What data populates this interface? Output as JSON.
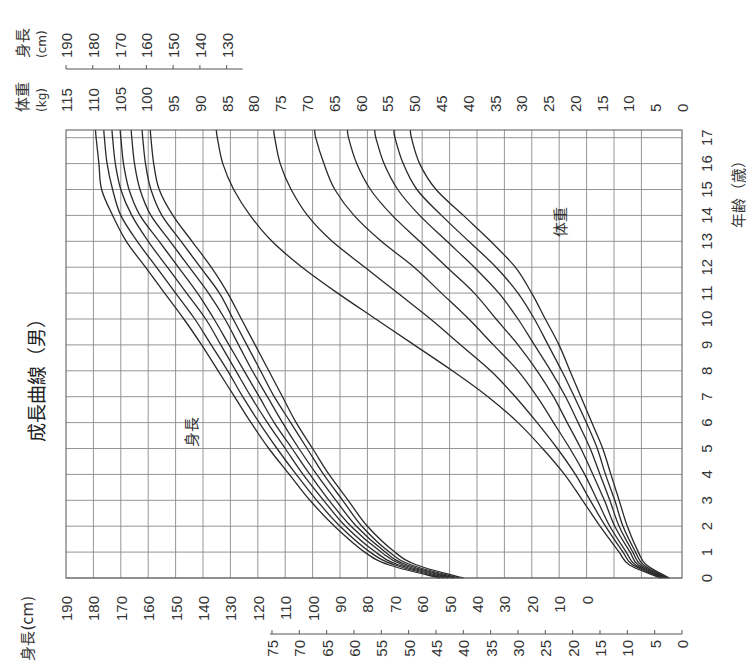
{
  "chart_data": {
    "type": "line",
    "title": "成長曲線（男）",
    "orientation": "rotated 90° counter-clockwise (age axis runs bottom-to-top on page)",
    "xlabel": "年齢（歳）",
    "x_ticks": [
      0,
      1,
      2,
      3,
      4,
      5,
      6,
      7,
      8,
      9,
      10,
      11,
      12,
      13,
      14,
      15,
      16,
      17
    ],
    "xlim": [
      0,
      17
    ],
    "y_axes": [
      {
        "name": "身長(cm)",
        "position": "left/bottom",
        "ticks": [
          190,
          180,
          170,
          160,
          150,
          140,
          130,
          120,
          110,
          100,
          90,
          80,
          70,
          60,
          50,
          40,
          30,
          20,
          10,
          0
        ],
        "range": [
          0,
          190
        ]
      },
      {
        "name": "体重(kg)",
        "position": "left/bottom",
        "ticks": [
          75,
          70,
          65,
          60,
          55,
          50,
          45,
          40,
          35,
          30,
          25,
          20,
          15,
          10,
          5,
          0
        ],
        "range": [
          0,
          75
        ]
      },
      {
        "name": "体重(kg)",
        "position": "right/top",
        "ticks": [
          115,
          110,
          105,
          100,
          95,
          90,
          85,
          80,
          75,
          70,
          65,
          60,
          55,
          50,
          45,
          40,
          35,
          30,
          25,
          20,
          15,
          10,
          5,
          0
        ],
        "range": [
          0,
          115
        ]
      },
      {
        "name": "身長(cm)",
        "position": "right/top",
        "ticks": [
          190,
          180,
          170,
          160,
          150,
          140,
          130
        ],
        "range": [
          130,
          190
        ]
      }
    ],
    "grid": true,
    "annotations": [
      "身長",
      "体重"
    ],
    "series_groups": [
      {
        "name": "身長",
        "unit": "cm",
        "percentiles": [
          "3",
          "10",
          "25",
          "50",
          "75",
          "90",
          "97"
        ],
        "x": [
          0,
          0.5,
          1,
          2,
          3,
          4,
          5,
          6,
          7,
          8,
          9,
          10,
          11,
          12,
          13,
          14,
          15,
          16,
          17
        ],
        "series": [
          {
            "name": "3%",
            "values": [
              45,
              62,
              70,
              80,
              87,
              94,
              100,
              106,
              111,
              116,
              121,
              126,
              131,
              137,
              144,
              151,
              156,
              158,
              159
            ]
          },
          {
            "name": "10%",
            "values": [
              46.5,
              64,
              72,
              82,
              89,
              96,
              102,
              108,
              114,
              119,
              124,
              129,
              134,
              141,
              148,
              155,
              159,
              161,
              162
            ]
          },
          {
            "name": "25%",
            "values": [
              48,
              65.5,
              73.5,
              84,
              91.5,
              98.5,
              105,
              111,
              116.5,
              122,
              127,
              132,
              138,
              145,
              152,
              159,
              163,
              165,
              166
            ]
          },
          {
            "name": "50%",
            "values": [
              49,
              67,
              75,
              86,
              94,
              101,
              107.5,
              114,
              119.5,
              125,
              130.5,
              136,
              142,
              149,
              156,
              163,
              167,
              169,
              170
            ]
          },
          {
            "name": "75%",
            "values": [
              50.5,
              68.5,
              77,
              88,
              96,
              103.5,
              110,
              116.5,
              122.5,
              128,
              133.5,
              139,
              146,
              153,
              160,
              166,
              170,
              172,
              173
            ]
          },
          {
            "name": "90%",
            "values": [
              52,
              70,
              79,
              90,
              98.5,
              106,
              113,
              119.5,
              125.5,
              131,
              137,
              143,
              150,
              157,
              164,
              170,
              173,
              175,
              176
            ]
          },
          {
            "name": "97%",
            "values": [
              53.5,
              72,
              81,
              92,
              101,
              108.5,
              116,
              122.5,
              128.5,
              134.5,
              140.5,
              147,
              154,
              161,
              168,
              173,
              177,
              178,
              179
            ]
          }
        ]
      },
      {
        "name": "体重",
        "unit": "kg",
        "percentiles": [
          "3",
          "10",
          "25",
          "50",
          "75",
          "90",
          "97"
        ],
        "x": [
          0,
          0.5,
          1,
          2,
          3,
          4,
          5,
          6,
          7,
          8,
          9,
          10,
          11,
          12,
          13,
          14,
          15,
          16,
          17
        ],
        "series": [
          {
            "name": "3%",
            "values": [
              2.3,
              6.5,
              8,
              10,
              11.5,
              13,
              14.5,
              16.5,
              18.5,
              20.5,
              22.5,
              25,
              27.5,
              30.5,
              35,
              40,
              45,
              48,
              49.5
            ]
          },
          {
            "name": "10%",
            "values": [
              2.6,
              7,
              8.5,
              10.8,
              12.3,
              14,
              15.5,
              17.5,
              19.7,
              22,
              24.5,
              27,
              30,
              34,
              39,
              44,
              48.5,
              51,
              52.5
            ]
          },
          {
            "name": "25%",
            "values": [
              2.8,
              7.5,
              9,
              11.5,
              13.2,
              15,
              16.8,
              19,
              21.3,
              24,
              27,
              30,
              33.5,
              38,
              43,
              48,
              52,
              54.5,
              56
            ]
          },
          {
            "name": "50%",
            "values": [
              3.0,
              8,
              9.5,
              12.3,
              14.2,
              16.3,
              18.5,
              21,
              23.5,
              26.5,
              30,
              34,
              38,
              43,
              48,
              53,
              57,
              59.5,
              61
            ]
          },
          {
            "name": "75%",
            "values": [
              3.3,
              8.5,
              10.2,
              13.2,
              15.5,
              17.8,
              20.5,
              23.5,
              26.5,
              30,
              34.5,
              39,
              44,
              49,
              55,
              60,
              63.5,
              65.5,
              67
            ]
          },
          {
            "name": "90%",
            "values": [
              3.6,
              9,
              10.8,
              14,
              16.8,
              19.5,
              22.8,
              26.5,
              30.5,
              35,
              40.5,
              46,
              52,
              58,
              64,
              68.5,
              71.5,
              73.5,
              74.5
            ]
          },
          {
            "name": "97%",
            "values": [
              3.9,
              9.6,
              11.5,
              15,
              18.2,
              21.5,
              25.5,
              30,
              35.5,
              42,
              49,
              56,
              63,
              69.5,
              75,
              79,
              82,
              84,
              85
            ]
          }
        ]
      }
    ]
  },
  "labels": {
    "title": "成長曲線（男）",
    "height_axis_left": "身長(cm)",
    "weight_axis_left_1": "体重",
    "weight_axis_left_2": "(kg)",
    "weight_axis_right_1": "体重",
    "weight_axis_right_2": "(kg)",
    "height_axis_right_1": "身長",
    "height_axis_right_2": "(cm)",
    "age_axis": "年齢（歳）",
    "height_annotation": "身長",
    "weight_annotation": "体重"
  }
}
